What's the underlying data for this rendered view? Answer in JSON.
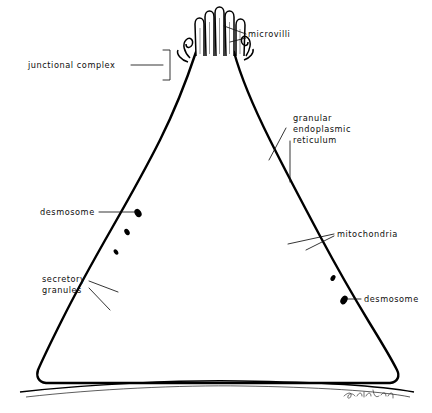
{
  "figure": {
    "kind": "scientific-line-drawing",
    "background_color": "#ffffff",
    "ink_color": "#000000",
    "signature": "artist signature (cursive, illegible)"
  },
  "labels": [
    {
      "id": "microvilli",
      "text": "microvilli",
      "x": 248,
      "y": 36,
      "anchor": "start",
      "lines": [
        "microvilli"
      ]
    },
    {
      "id": "junctional-complex",
      "text": "junctional complex",
      "x": 28,
      "y": 68,
      "anchor": "start",
      "lines": [
        "junctional complex"
      ]
    },
    {
      "id": "granular-endoplasmic-reticulum",
      "text": "granular endoplasmic reticulum",
      "x": 288,
      "y": 121,
      "anchor": "start",
      "lines": [
        "granular",
        "endoplasmic",
        "reticulum"
      ]
    },
    {
      "id": "desmosome-left",
      "text": "desmosome",
      "x": 40,
      "y": 215,
      "anchor": "start",
      "lines": [
        "desmosome"
      ]
    },
    {
      "id": "mitochondria",
      "text": "mitochondria",
      "x": 336,
      "y": 236,
      "anchor": "start",
      "lines": [
        "mitochondria"
      ]
    },
    {
      "id": "secretory-granules",
      "text": "secretory granules",
      "x": 42,
      "y": 285,
      "anchor": "start",
      "lines": [
        "secretory",
        "granules"
      ]
    },
    {
      "id": "desmosome-right",
      "text": "desmosome",
      "x": 363,
      "y": 302,
      "anchor": "start",
      "lines": [
        "desmosome"
      ]
    }
  ],
  "structures": {
    "microvilli_count": 5,
    "nucleus": {
      "description": "large indented (kidney-shaped) nucleus with stippled chromatin and a dense nucleolus",
      "cx": 210,
      "cy": 288,
      "r": 62
    },
    "organelle_types": [
      "microvilli",
      "junctional complex",
      "desmosome",
      "granular endoplasmic reticulum",
      "mitochondria",
      "secretory granules",
      "nucleus",
      "nucleolus",
      "basal lamina"
    ]
  }
}
